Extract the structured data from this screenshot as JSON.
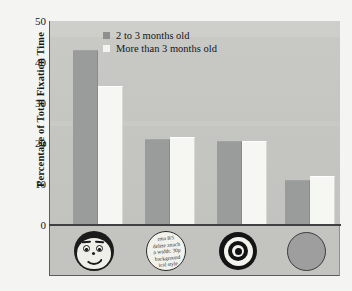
{
  "chart_data": {
    "type": "bar",
    "title": "",
    "subtitle": "",
    "xlabel": "",
    "ylabel": "Percentage of Total Fixation Time",
    "ylim": [
      0,
      50
    ],
    "yticks": [
      50,
      40,
      30,
      20,
      10,
      0
    ],
    "grid": false,
    "legend_position": "top-center",
    "categories": [
      "face",
      "newsprint",
      "bullseye",
      "plain disc"
    ],
    "category_icons": [
      "face-icon",
      "newsprint-circle-icon",
      "bullseye-icon",
      "plain-disc-icon"
    ],
    "series": [
      {
        "name": "2 to 3 months old",
        "values": [
          43.0,
          21.0,
          20.5,
          11.0
        ],
        "color": "#9a9b9b"
      },
      {
        "name": "More than 3 months old",
        "values": [
          34.0,
          21.5,
          20.5,
          12.0
        ],
        "color": "#f6f6f3"
      }
    ]
  },
  "axis": {
    "y_title": "Percentage of Total Fixation Time",
    "tick_labels": [
      "50",
      "40",
      "30",
      "20",
      "10",
      "0"
    ]
  },
  "legend": {
    "entries": [
      {
        "label": "2 to 3 months old"
      },
      {
        "label": "More than 3 months old"
      }
    ]
  },
  "icons": {
    "newsprint_text": [
      "rma 8/5",
      "delete attach",
      "n width: 30p",
      "background",
      "ical style"
    ]
  },
  "colors": {
    "series_1": "#9a9b9b",
    "series_2": "#f6f6f3",
    "plot_background": "#c7c7c3",
    "page_background": "#f4f4f2",
    "axis": "#3e4042",
    "text": "#15171a"
  }
}
